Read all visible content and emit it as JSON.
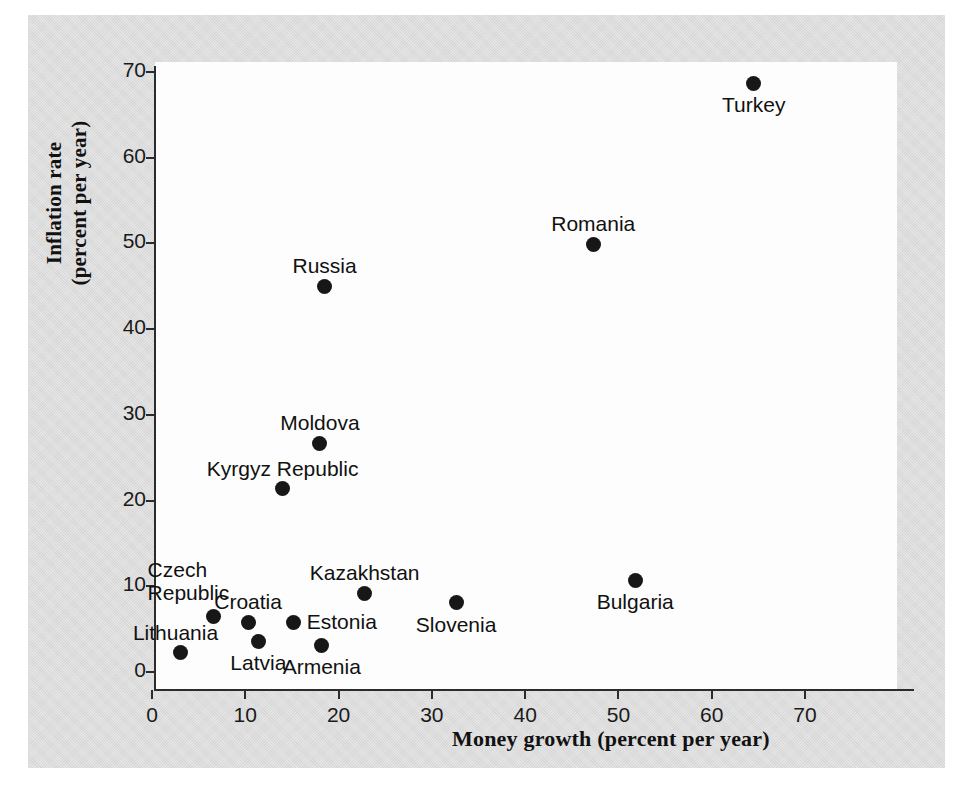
{
  "figure": {
    "background_color": "#dcdcdc",
    "plot_background_color": "#fdfdfd",
    "marker_color": "#171717"
  },
  "chart_data": {
    "type": "scatter",
    "title": "",
    "xlabel": "Money growth (percent per year)",
    "ylabel_line1": "Inflation rate",
    "ylabel_line2": "(percent per year)",
    "xlim": [
      0,
      76
    ],
    "ylim": [
      0,
      72
    ],
    "xticks": [
      0,
      10,
      20,
      30,
      40,
      50,
      60,
      70
    ],
    "yticks": [
      0,
      10,
      20,
      30,
      40,
      50,
      60,
      70
    ],
    "grid": false,
    "legend": null,
    "points": [
      {
        "name": "Turkey",
        "x": 64.5,
        "y": 68.7,
        "label_pos": "below"
      },
      {
        "name": "Romania",
        "x": 47.3,
        "y": 49.9,
        "label_pos": "above"
      },
      {
        "name": "Russia",
        "x": 18.5,
        "y": 45.0,
        "label_pos": "above"
      },
      {
        "name": "Moldova",
        "x": 18.0,
        "y": 26.7,
        "label_pos": "above"
      },
      {
        "name": "Kyrgyz Republic",
        "x": 14.0,
        "y": 21.4,
        "label_pos": "above"
      },
      {
        "name": "Bulgaria",
        "x": 51.8,
        "y": 10.7,
        "label_pos": "below"
      },
      {
        "name": "Kazakhstan",
        "x": 22.8,
        "y": 9.2,
        "label_pos": "above"
      },
      {
        "name": "Slovenia",
        "x": 32.6,
        "y": 8.1,
        "label_pos": "below"
      },
      {
        "name": "Czech Republic",
        "x": 6.6,
        "y": 6.5,
        "label_pos": "upper-left-2"
      },
      {
        "name": "Croatia",
        "x": 10.3,
        "y": 5.8,
        "label_pos": "above"
      },
      {
        "name": "Estonia",
        "x": 15.2,
        "y": 5.8,
        "label_pos": "right"
      },
      {
        "name": "Latvia",
        "x": 11.4,
        "y": 3.6,
        "label_pos": "below"
      },
      {
        "name": "Armenia",
        "x": 18.2,
        "y": 3.1,
        "label_pos": "below"
      },
      {
        "name": "Lithuania",
        "x": 3.1,
        "y": 2.3,
        "label_pos": "above-left"
      }
    ]
  }
}
